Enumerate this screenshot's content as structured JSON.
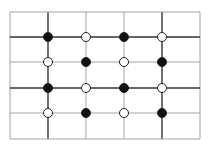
{
  "diagram": {
    "type": "grid-with-dots",
    "frame": {
      "x0": 10,
      "y0": 12,
      "x1": 200,
      "y1": 139
    },
    "vertical_lines": [
      {
        "x": 10,
        "weight": "light"
      },
      {
        "x": 48,
        "weight": "dark"
      },
      {
        "x": 86,
        "weight": "light"
      },
      {
        "x": 124,
        "weight": "light"
      },
      {
        "x": 162,
        "weight": "dark"
      },
      {
        "x": 200,
        "weight": "light"
      }
    ],
    "horizontal_lines": [
      {
        "y": 12,
        "weight": "light"
      },
      {
        "y": 37,
        "weight": "dark"
      },
      {
        "y": 62,
        "weight": "light"
      },
      {
        "y": 88,
        "weight": "dark"
      },
      {
        "y": 113,
        "weight": "light"
      },
      {
        "y": 139,
        "weight": "light"
      }
    ],
    "dot_columns_x": [
      48,
      86,
      124,
      162
    ],
    "dot_rows_y": [
      37,
      62,
      88,
      113
    ],
    "dots": [
      [
        "filled",
        "open",
        "filled",
        "open"
      ],
      [
        "open",
        "filled",
        "open",
        "filled"
      ],
      [
        "filled",
        "open",
        "filled",
        "open"
      ],
      [
        "open",
        "filled",
        "open",
        "filled"
      ]
    ],
    "dot_radius": 4.5,
    "colors": {
      "dark_line": "#333333",
      "light_line": "#9a9a9a",
      "filled_dot": "#111111",
      "open_dot_fill": "#ffffff",
      "dot_stroke": "#222222"
    }
  }
}
